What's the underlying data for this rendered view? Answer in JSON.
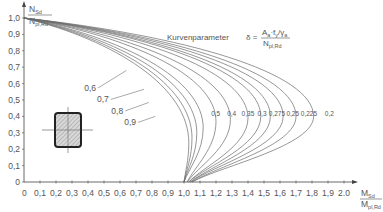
{
  "chart_data": {
    "type": "line",
    "title": "",
    "xlabel": {
      "numerator": "M",
      "numerator_sub": "Sd",
      "denominator": "M",
      "denominator_sub": "pl,Rd"
    },
    "ylabel": {
      "numerator": "N",
      "numerator_sub": "Sd",
      "denominator": "N",
      "denominator_sub": "pl,Rd"
    },
    "xlim": [
      0,
      2.0
    ],
    "ylim": [
      0,
      1.0
    ],
    "x_ticks": [
      "0,1",
      "0,2",
      "0,3",
      "0,4",
      "0,5",
      "0,6",
      "0,7",
      "0,8",
      "0,9",
      "1,0",
      "1,1",
      "1,2",
      "1,3",
      "1,4",
      "1,5",
      "1,6",
      "1,7",
      "1,8",
      "1,9",
      "2.0"
    ],
    "x_origin_label": "0",
    "y_ticks": [
      "0",
      "0,1",
      "0,2",
      "0,3",
      "0,4",
      "0,5",
      "0,6",
      "0,7",
      "0,8",
      "0,9",
      "1,0"
    ],
    "grid": false,
    "annotation": {
      "label": "Kurvenparameter",
      "symbol": "δ =",
      "numerator": "A",
      "numerator_sub1": "a",
      "numerator_mid": "·f",
      "numerator_sub2": "y",
      "numerator_tail": "/γ",
      "numerator_sub3": "a",
      "denominator": "N",
      "denominator_sub": "pl,Rd"
    },
    "series": [
      {
        "name": "0,2",
        "delta": 0.2,
        "m_max": 1.81,
        "n_at_max": 0.4,
        "m_end": 1.05
      },
      {
        "name": "0,225",
        "delta": 0.225,
        "m_max": 1.7,
        "n_at_max": 0.4,
        "m_end": 1.05
      },
      {
        "name": "0,25",
        "delta": 0.25,
        "m_max": 1.62,
        "n_at_max": 0.4,
        "m_end": 1.04
      },
      {
        "name": "0,275",
        "delta": 0.275,
        "m_max": 1.54,
        "n_at_max": 0.4,
        "m_end": 1.04
      },
      {
        "name": "0,3",
        "delta": 0.3,
        "m_max": 1.48,
        "n_at_max": 0.4,
        "m_end": 1.03
      },
      {
        "name": "0,35",
        "delta": 0.35,
        "m_max": 1.4,
        "n_at_max": 0.39,
        "m_end": 1.03
      },
      {
        "name": "0,4",
        "delta": 0.4,
        "m_max": 1.29,
        "n_at_max": 0.38,
        "m_end": 1.02
      },
      {
        "name": "0,5",
        "delta": 0.5,
        "m_max": 1.2,
        "n_at_max": 0.37,
        "m_end": 1.02
      },
      {
        "name": "0,6",
        "delta": 0.6,
        "m_max": 1.12,
        "n_at_max": 0.33,
        "m_end": 1.0
      },
      {
        "name": "0,7",
        "delta": 0.7,
        "m_max": 1.08,
        "n_at_max": 0.3,
        "m_end": 1.0
      },
      {
        "name": "0,8",
        "delta": 0.8,
        "m_max": 1.05,
        "n_at_max": 0.27,
        "m_end": 1.0
      },
      {
        "name": "0,9",
        "delta": 0.9,
        "m_max": 1.03,
        "n_at_max": 0.24,
        "m_end": 1.0
      }
    ],
    "inner_labels": [
      {
        "text": "0,5",
        "x": 1.17,
        "y": 0.405
      },
      {
        "text": "0,4",
        "x": 1.27,
        "y": 0.405
      },
      {
        "text": "0,35",
        "x": 1.36,
        "y": 0.405
      },
      {
        "text": "0,3",
        "x": 1.46,
        "y": 0.405
      },
      {
        "text": "0,275",
        "x": 1.53,
        "y": 0.405
      },
      {
        "text": "0,25",
        "x": 1.64,
        "y": 0.405
      },
      {
        "text": "0,225",
        "x": 1.73,
        "y": 0.405
      },
      {
        "text": "0,2",
        "x": 1.88,
        "y": 0.405
      }
    ],
    "leader_labels": [
      {
        "text": "0,6",
        "x": 0.45,
        "y": 0.555,
        "tx": 0.64,
        "ty": 0.68
      },
      {
        "text": "0,7",
        "x": 0.53,
        "y": 0.485,
        "tx": 0.75,
        "ty": 0.565
      },
      {
        "text": "0,8",
        "x": 0.62,
        "y": 0.415,
        "tx": 0.78,
        "ty": 0.485
      },
      {
        "text": "0,9",
        "x": 0.7,
        "y": 0.345,
        "tx": 0.82,
        "ty": 0.4
      }
    ]
  },
  "icons": {
    "cross_section": "hatched-rectangular-hollow-section-icon"
  }
}
